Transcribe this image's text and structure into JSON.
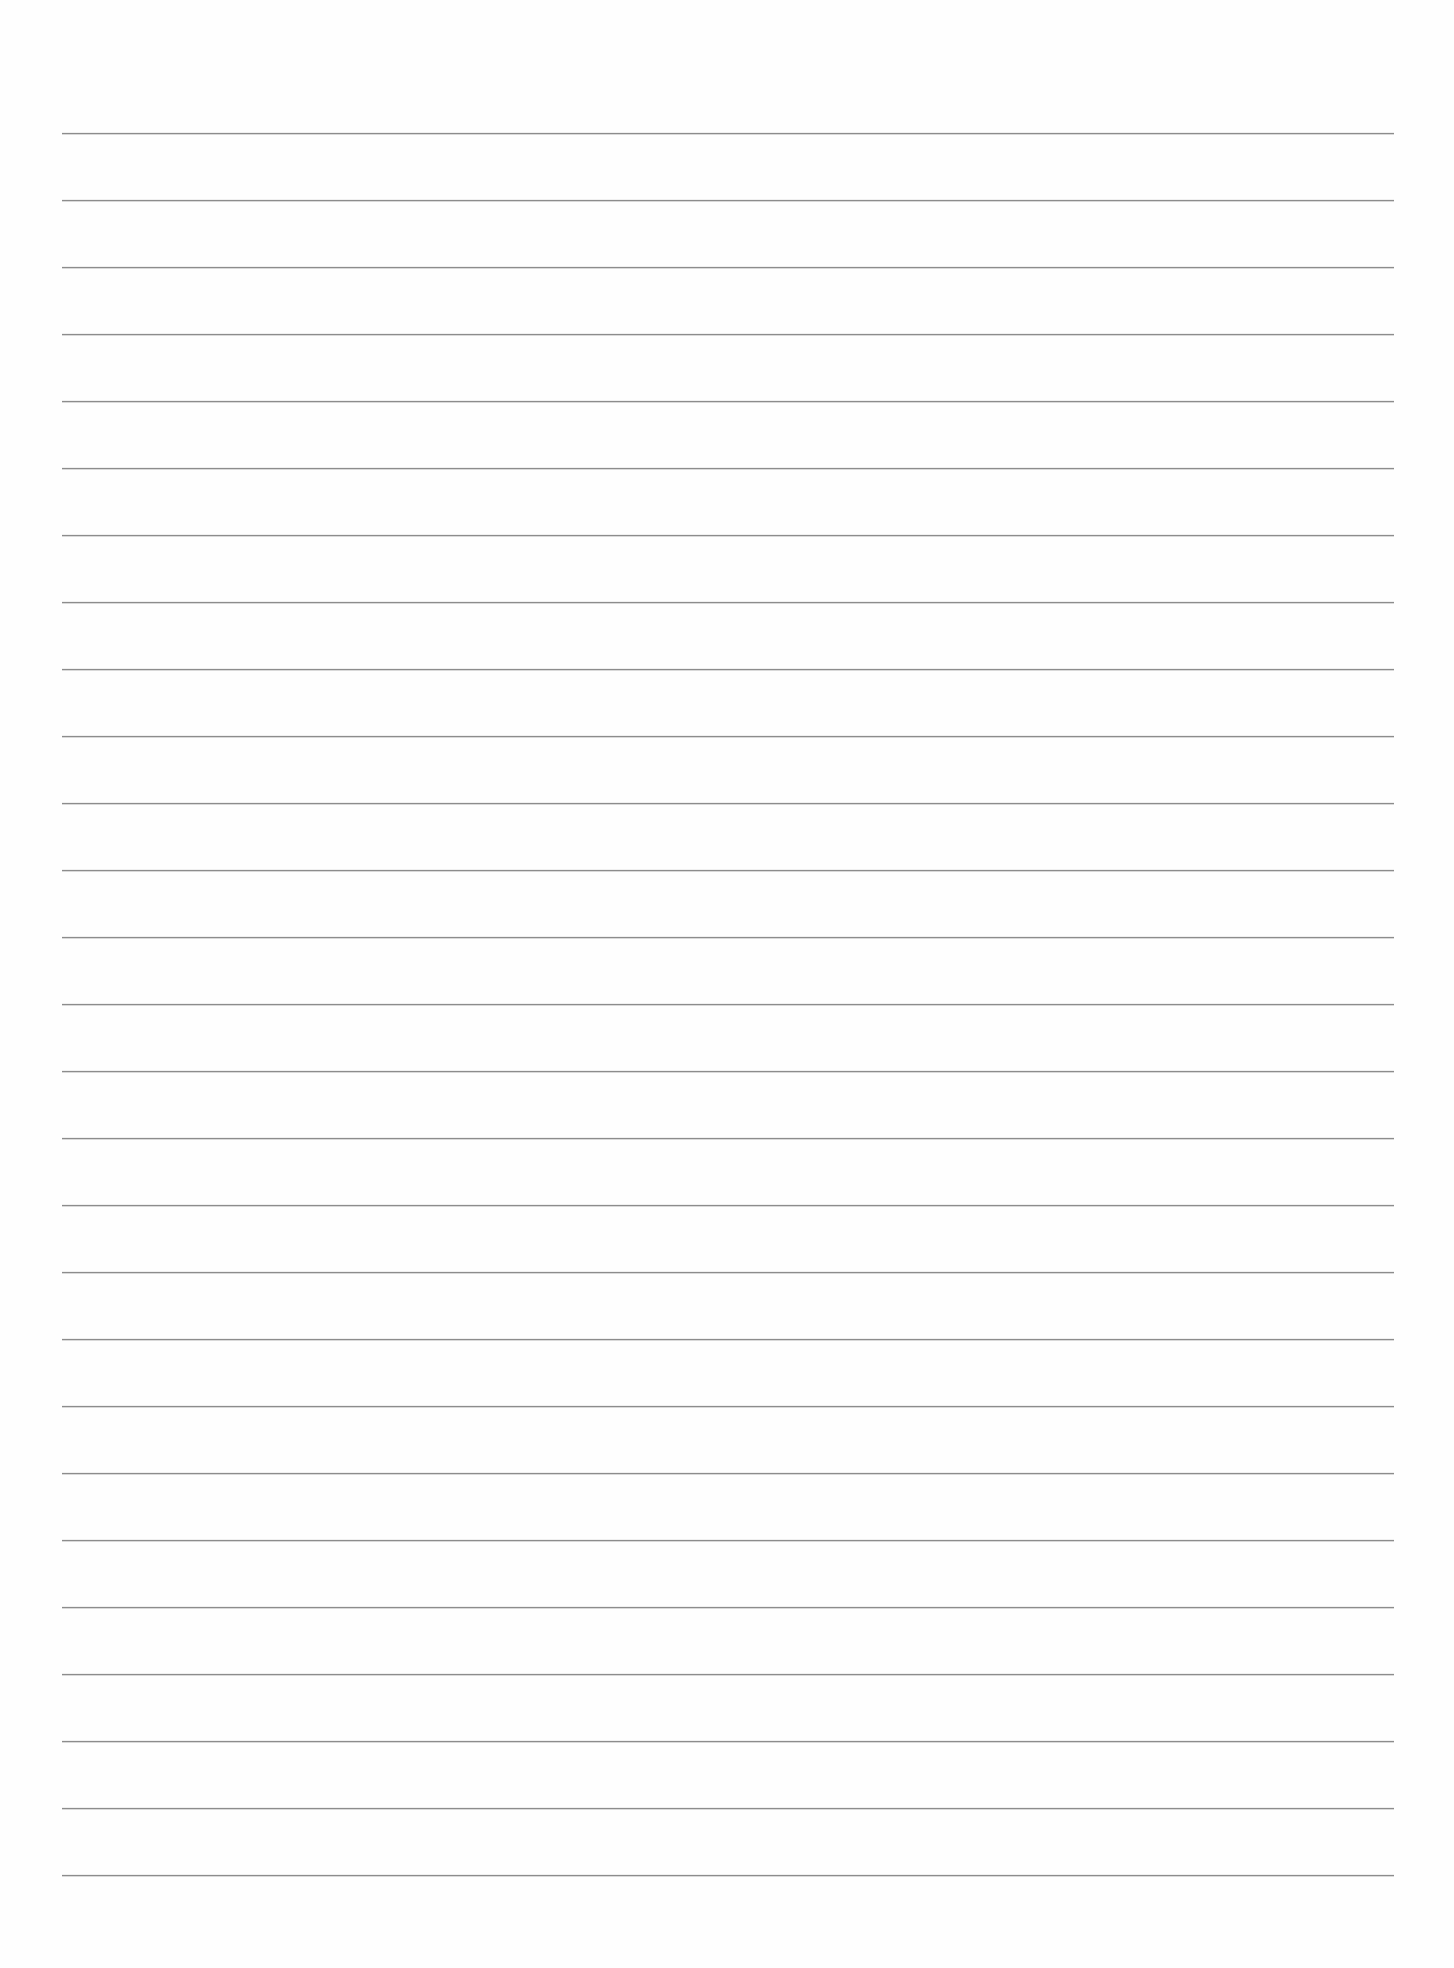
{
  "document": {
    "type": "lined-paper",
    "background_color": "#fefefe",
    "rule_color": "#8c8c8c",
    "rule_count": 27,
    "rule_left_px": 62,
    "rule_right_px": 1394,
    "first_rule_y_px": 133,
    "rule_spacing_px": 67,
    "text_content": []
  }
}
